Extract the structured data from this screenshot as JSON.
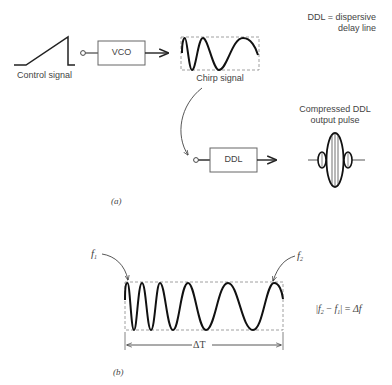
{
  "part_a": {
    "label": "(a)",
    "legend": {
      "line1": "DDL = dispersive",
      "line2": "delay line"
    },
    "control_signal": {
      "label": "Control signal"
    },
    "vco_block": {
      "label": "VCO"
    },
    "chirp_signal": {
      "label": "Chirp signal"
    },
    "ddl_block": {
      "label": "DDL"
    },
    "output_pulse": {
      "line1": "Compressed DDL",
      "line2": "output pulse"
    }
  },
  "part_b": {
    "label": "(b)",
    "f1_label": {
      "base": "f",
      "sub": "1"
    },
    "f2_label": {
      "base": "f",
      "sub": "2"
    },
    "duration_label": "ΔT",
    "equation": {
      "lhs_open": "|",
      "f2": "f",
      "f2_sub": "2",
      "minus": " − ",
      "f1": "f",
      "f1_sub": "1",
      "lhs_close": "|",
      "equals": " = ",
      "rhs": "Δf"
    }
  },
  "colors": {
    "stroke": "#222222",
    "text": "#444444",
    "dashed": "#888888",
    "background": "#ffffff"
  }
}
